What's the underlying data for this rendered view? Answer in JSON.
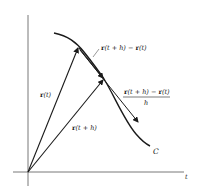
{
  "figure": {
    "axis": {
      "horizontal_label": "t"
    },
    "curve": {
      "label": "C"
    },
    "vectors": {
      "r_t": {
        "bold": "r",
        "arg": "(t)"
      },
      "r_t_plus_h": {
        "bold": "r",
        "arg": "(t + h)"
      }
    },
    "secant": {
      "difference_label": "r(t + h) − r(t)",
      "difference_parts": {
        "r1": "r",
        "a1": "(t + h) − ",
        "r2": "r",
        "a2": "(t)"
      },
      "quotient_numerator_parts": {
        "r1": "r",
        "a1": "(t + h) − ",
        "r2": "r",
        "a2": "(t)"
      },
      "quotient_denominator": "h"
    },
    "colors": {
      "stroke": "#1a1a1a",
      "axis": "#555555",
      "text": "#222222"
    }
  }
}
